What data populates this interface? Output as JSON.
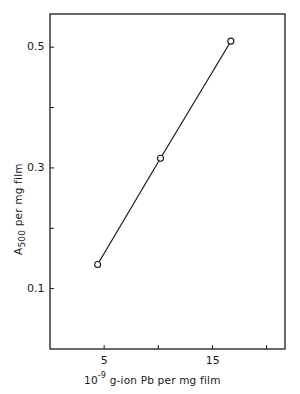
{
  "chart_data": {
    "type": "line",
    "title": "",
    "xlabel": "10^-9 g-ion Pb per mg film",
    "ylabel": "A500 per mg film",
    "xlim": [
      0,
      21.7
    ],
    "ylim": [
      0.0,
      0.555
    ],
    "grid": false,
    "legend": null,
    "x_ticks": [
      5,
      10,
      15,
      20
    ],
    "x_tick_labels": [
      "5",
      "",
      "15",
      ""
    ],
    "y_ticks": [
      0.1,
      0.2,
      0.3,
      0.4,
      0.5
    ],
    "y_tick_labels": [
      "0.1",
      "",
      "0.3",
      "",
      "0.5"
    ],
    "series": [
      {
        "name": "A500 vs Pb",
        "marker": "open-circle",
        "x": [
          4.4,
          10.2,
          16.7
        ],
        "y": [
          0.14,
          0.316,
          0.51
        ]
      }
    ]
  },
  "labels": {
    "x_prefix": "10",
    "x_exp": "-9",
    "x_rest": " g-ion Pb per mg film",
    "y_main": "A",
    "y_sub": "500",
    "y_rest": " per mg film"
  },
  "colors": {
    "ink": "#1a1a1a",
    "background": "#ffffff"
  }
}
